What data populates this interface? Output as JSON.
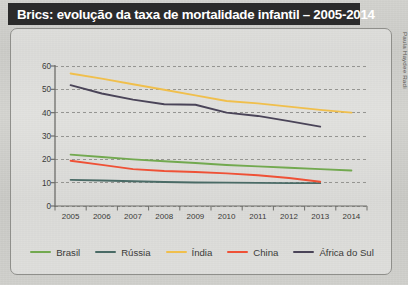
{
  "title": "Brics: evolução da taxa de mortalidade infantil – 2005-2014",
  "credit": "Paula Haydee Radi",
  "chart_data": {
    "type": "line",
    "title": "Brics: evolução da taxa de mortalidade infantil – 2005-2014",
    "xlabel": "",
    "ylabel": "",
    "x": [
      2005,
      2006,
      2007,
      2008,
      2009,
      2010,
      2011,
      2012,
      2013,
      2014
    ],
    "categories": [
      "2005",
      "2006",
      "2007",
      "2008",
      "2009",
      "2010",
      "2011",
      "2012",
      "2013",
      "2014"
    ],
    "ylim": [
      0,
      60
    ],
    "yticks": [
      0,
      10,
      20,
      30,
      40,
      50,
      60
    ],
    "ytick_labels": [
      "0",
      "10",
      "20",
      "30",
      "40",
      "50",
      "60"
    ],
    "grid": "horizontal-dashed",
    "legend_position": "bottom",
    "series": [
      {
        "name": "Brasil",
        "color": "#72a94f",
        "values": [
          22.0,
          21.0,
          20.0,
          19.2,
          18.4,
          17.6,
          17.0,
          16.4,
          15.8,
          15.2
        ]
      },
      {
        "name": "Rússia",
        "color": "#4a6b66",
        "values": [
          11.2,
          10.9,
          10.6,
          10.3,
          10.1,
          10.0,
          9.9,
          9.8,
          9.8,
          null
        ]
      },
      {
        "name": "Índia",
        "color": "#f0bf4c",
        "values": [
          56.8,
          54.6,
          52.2,
          49.8,
          47.4,
          45.0,
          44.0,
          42.6,
          41.2,
          40.0
        ]
      },
      {
        "name": "China",
        "color": "#ef5136",
        "values": [
          19.4,
          17.6,
          15.8,
          15.0,
          14.6,
          14.0,
          13.2,
          12.0,
          10.4,
          null
        ]
      },
      {
        "name": "África do Sul",
        "color": "#4a4458",
        "values": [
          51.8,
          48.2,
          45.6,
          43.6,
          43.4,
          40.0,
          38.6,
          36.4,
          34.0,
          null
        ]
      }
    ]
  },
  "legend": {
    "items": [
      {
        "label": "Brasil",
        "color": "#72a94f"
      },
      {
        "label": "Rússia",
        "color": "#4a6b66"
      },
      {
        "label": "Índia",
        "color": "#f0bf4c"
      },
      {
        "label": "China",
        "color": "#ef5136"
      },
      {
        "label": "África do Sul",
        "color": "#4a4458"
      }
    ]
  }
}
